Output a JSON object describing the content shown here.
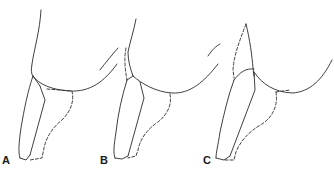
{
  "figure": {
    "panels": [
      {
        "id": "A",
        "label": "A"
      },
      {
        "id": "B",
        "label": "B"
      },
      {
        "id": "C",
        "label": "C"
      }
    ],
    "line_color": "#2a2a2a",
    "background": "#ffffff"
  }
}
